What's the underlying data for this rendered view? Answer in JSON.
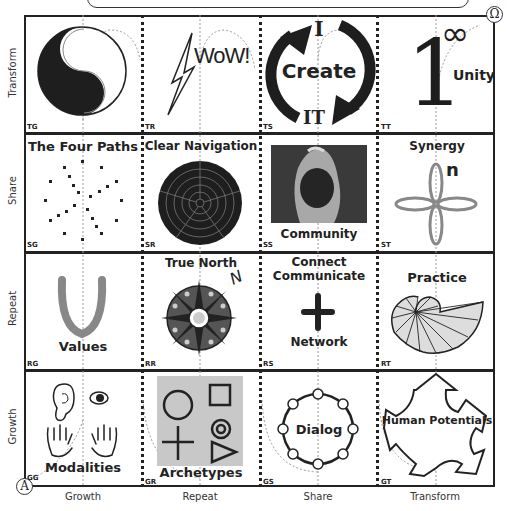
{
  "diagram": {
    "corner_start": "A",
    "corner_end": "Ω",
    "row_labels": [
      "Transform",
      "Share",
      "Repeat",
      "Growth"
    ],
    "column_labels": [
      "Growth",
      "Repeat",
      "Share",
      "Transform"
    ],
    "cells": [
      {
        "code": "TG",
        "label": "",
        "icon": "yin-yang-icon"
      },
      {
        "code": "TR",
        "label": "WoW!",
        "icon": "lightning-bolt-icon"
      },
      {
        "code": "TS",
        "label": "Create",
        "top": "I",
        "bottom": "IT",
        "icon": "cycle-arrows-icon"
      },
      {
        "code": "TT",
        "label": "Unity",
        "numeral": "1",
        "symbol": "∞",
        "icon": "one-infinity-icon"
      },
      {
        "code": "SG",
        "label": "The Four Paths",
        "icon": "dot-pattern-icon"
      },
      {
        "code": "SR",
        "label": "Clear Navigation",
        "icon": "radar-target-icon"
      },
      {
        "code": "SS",
        "label": "Community",
        "icon": "community-photo"
      },
      {
        "code": "ST",
        "label": "Synergy",
        "superscript": "n",
        "icon": "four-petal-icon"
      },
      {
        "code": "RG",
        "label": "Values",
        "icon": "v-shape-icon"
      },
      {
        "code": "RR",
        "label": "True North",
        "compass_letter": "N",
        "icon": "compass-rose-icon"
      },
      {
        "code": "RS",
        "label": "Connect",
        "label2": "Communicate",
        "label3": "Network",
        "icon": "plus-icon"
      },
      {
        "code": "RT",
        "label": "Practice",
        "icon": "nautilus-shell-icon"
      },
      {
        "code": "GG",
        "label": "Modalities",
        "icon": "senses-icon"
      },
      {
        "code": "GR",
        "label": "Archetypes",
        "icon": "archetype-shapes-icon"
      },
      {
        "code": "GS",
        "label": "Dialog",
        "icon": "dialog-circle-icon"
      },
      {
        "code": "GT",
        "label": "Human Potentials",
        "icon": "five-arrows-icon"
      }
    ]
  },
  "colors": {
    "line": "#222222",
    "gray_accent": "#888888",
    "light_gray": "#c8c8c8",
    "dark_fill": "#1e1e1e"
  }
}
